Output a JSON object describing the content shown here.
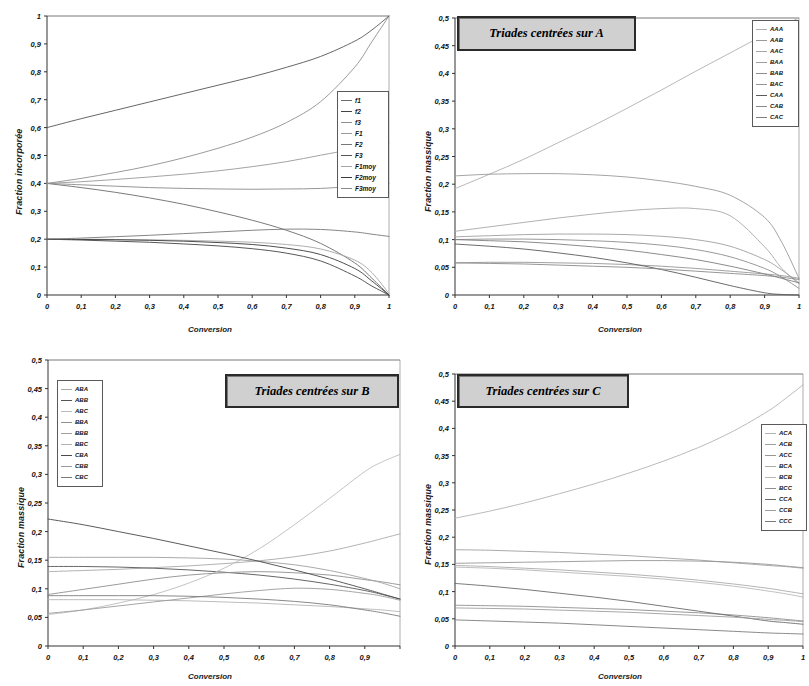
{
  "figure": {
    "panels": [
      {
        "id": "panel-1",
        "title": "",
        "xlabel": "Conversion",
        "ylabel": "Fraction incorporée",
        "xticks": [
          "0",
          "0,1",
          "0,2",
          "0,3",
          "0,4",
          "0,5",
          "0,6",
          "0,7",
          "0,8",
          "0,9",
          "1"
        ],
        "yticks": [
          "0",
          "0,1",
          "0,2",
          "0,3",
          "0,4",
          "0,5",
          "0,6",
          "0,7",
          "0,8",
          "0,9",
          "1"
        ],
        "legend": [
          "f1",
          "f2",
          "f3",
          "F1",
          "F2",
          "F3",
          "F1moy",
          "F2moy",
          "F3moy"
        ]
      },
      {
        "id": "panel-2",
        "title": "Triades centrées sur A",
        "xlabel": "Conversion",
        "ylabel": "Fraction massique",
        "xticks": [
          "0",
          "0,1",
          "0,2",
          "0,3",
          "0,4",
          "0,5",
          "0,6",
          "0,7",
          "0,8",
          "0,9",
          "1"
        ],
        "yticks": [
          "0",
          "0,05",
          "0,1",
          "0,15",
          "0,2",
          "0,25",
          "0,3",
          "0,35",
          "0,4",
          "0,45",
          "0,5"
        ],
        "legend": [
          "AAA",
          "AAB",
          "AAC",
          "BAA",
          "BAB",
          "BAC",
          "CAA",
          "CAB",
          "CAC"
        ]
      },
      {
        "id": "panel-3",
        "title": "Triades centrées sur B",
        "xlabel": "Conversion",
        "ylabel": "Fraction massique",
        "xticks": [
          "0",
          "0,1",
          "0,2",
          "0,3",
          "0,4",
          "0,5",
          "0,6",
          "0,7",
          "0,8",
          "0,9"
        ],
        "yticks": [
          "0",
          "0,05",
          "0,1",
          "0,15",
          "0,2",
          "0,25",
          "0,3",
          "0,35",
          "0,4",
          "0,45",
          "0,5"
        ],
        "legend": [
          "ABA",
          "ABB",
          "ABC",
          "BBA",
          "BBB",
          "BBC",
          "CBA",
          "CBB",
          "CBC"
        ]
      },
      {
        "id": "panel-4",
        "title": "Triades centrées sur C",
        "xlabel": "Conversion",
        "ylabel": "Fraction massique",
        "xticks": [
          "0",
          "0,1",
          "0,2",
          "0,3",
          "0,4",
          "0,5",
          "0,6",
          "0,7",
          "0,8",
          "0,9",
          "1"
        ],
        "yticks": [
          "0",
          "0,05",
          "0,1",
          "0,15",
          "0,2",
          "0,25",
          "0,3",
          "0,35",
          "0,4",
          "0,45",
          "0,5"
        ],
        "legend": [
          "ACA",
          "ACB",
          "ACC",
          "BCA",
          "BCB",
          "BCC",
          "CCA",
          "CCB",
          "CCC"
        ]
      }
    ]
  },
  "chart_data": [
    {
      "type": "line",
      "panel": "panel-1",
      "title": "",
      "xlabel": "Conversion",
      "ylabel": "Fraction incorporée",
      "xlim": [
        0,
        1
      ],
      "ylim": [
        0,
        1
      ],
      "grid": false,
      "legend_position": "right-middle",
      "x": [
        0,
        0.1,
        0.2,
        0.3,
        0.4,
        0.5,
        0.6,
        0.7,
        0.8,
        0.9,
        0.95,
        1
      ],
      "series": [
        {
          "name": "f1",
          "color": "#6b6b6b",
          "values": [
            0.4,
            0.385,
            0.368,
            0.348,
            0.325,
            0.298,
            0.268,
            0.232,
            0.185,
            0.115,
            0.06,
            0.0
          ]
        },
        {
          "name": "f2",
          "color": "#444444",
          "values": [
            0.2,
            0.197,
            0.193,
            0.189,
            0.183,
            0.176,
            0.166,
            0.15,
            0.122,
            0.068,
            0.032,
            0.0
          ]
        },
        {
          "name": "f3",
          "color": "#8f8f8f",
          "values": [
            0.4,
            0.418,
            0.439,
            0.463,
            0.492,
            0.526,
            0.566,
            0.618,
            0.693,
            0.817,
            0.908,
            1.0
          ]
        },
        {
          "name": "F1",
          "color": "#999999",
          "values": [
            0.4,
            0.406,
            0.414,
            0.423,
            0.433,
            0.445,
            0.46,
            0.478,
            0.501,
            0.524,
            0.536,
            0.545
          ]
        },
        {
          "name": "F2",
          "color": "#777777",
          "values": [
            0.2,
            0.204,
            0.209,
            0.214,
            0.22,
            0.226,
            0.232,
            0.236,
            0.235,
            0.226,
            0.218,
            0.21
          ]
        },
        {
          "name": "F3",
          "color": "#555555",
          "values": [
            0.6,
            0.632,
            0.662,
            0.692,
            0.722,
            0.752,
            0.782,
            0.816,
            0.855,
            0.91,
            0.95,
            1.0
          ]
        },
        {
          "name": "F1moy",
          "color": "#a5a5a5",
          "values": [
            0.2,
            0.2,
            0.199,
            0.198,
            0.196,
            0.193,
            0.189,
            0.181,
            0.165,
            0.125,
            0.08,
            0.005
          ]
        },
        {
          "name": "F2moy",
          "color": "#3a3a3a",
          "values": [
            0.2,
            0.199,
            0.198,
            0.196,
            0.193,
            0.188,
            0.181,
            0.168,
            0.145,
            0.095,
            0.05,
            0.0
          ]
        },
        {
          "name": "F3moy",
          "color": "#8a8a8a",
          "values": [
            0.4,
            0.395,
            0.39,
            0.385,
            0.382,
            0.38,
            0.379,
            0.38,
            0.382,
            0.39,
            0.395,
            0.4
          ]
        }
      ]
    },
    {
      "type": "line",
      "panel": "panel-2",
      "title": "Triades centrées sur A",
      "xlabel": "Conversion",
      "ylabel": "Fraction massique",
      "xlim": [
        0,
        1
      ],
      "ylim": [
        0,
        0.5
      ],
      "grid": false,
      "legend_position": "top-right",
      "x": [
        0,
        0.1,
        0.2,
        0.3,
        0.4,
        0.5,
        0.6,
        0.7,
        0.8,
        0.9,
        0.95,
        1
      ],
      "series": [
        {
          "name": "AAA",
          "color": "#b0b0b0",
          "values": [
            0.192,
            0.218,
            0.245,
            0.275,
            0.305,
            0.337,
            0.37,
            0.404,
            0.437,
            0.47,
            0.486,
            0.5
          ]
        },
        {
          "name": "AAB",
          "color": "#9a9a9a",
          "values": [
            0.215,
            0.218,
            0.219,
            0.219,
            0.217,
            0.213,
            0.206,
            0.196,
            0.18,
            0.14,
            0.095,
            0.03
          ]
        },
        {
          "name": "AAC",
          "color": "#a8a8a8",
          "values": [
            0.115,
            0.123,
            0.131,
            0.139,
            0.146,
            0.152,
            0.156,
            0.156,
            0.143,
            0.087,
            0.048,
            0.02
          ]
        },
        {
          "name": "BAA",
          "color": "#9f9f9f",
          "values": [
            0.105,
            0.107,
            0.109,
            0.11,
            0.11,
            0.109,
            0.106,
            0.1,
            0.088,
            0.064,
            0.045,
            0.022
          ]
        },
        {
          "name": "BAB",
          "color": "#8d8d8d",
          "values": [
            0.1,
            0.101,
            0.101,
            0.1,
            0.098,
            0.095,
            0.09,
            0.082,
            0.069,
            0.048,
            0.032,
            0.012
          ]
        },
        {
          "name": "BAC",
          "color": "#959595",
          "values": [
            0.058,
            0.059,
            0.059,
            0.058,
            0.057,
            0.055,
            0.052,
            0.048,
            0.043,
            0.038,
            0.035,
            0.03
          ]
        },
        {
          "name": "CAA",
          "color": "#5a5a5a",
          "values": [
            0.092,
            0.088,
            0.083,
            0.076,
            0.068,
            0.058,
            0.046,
            0.032,
            0.017,
            0.004,
            0.001,
            0.0
          ]
        },
        {
          "name": "CAB",
          "color": "#8a8a8a",
          "values": [
            0.058,
            0.057,
            0.056,
            0.054,
            0.052,
            0.05,
            0.047,
            0.043,
            0.039,
            0.035,
            0.032,
            0.028
          ]
        },
        {
          "name": "CAC",
          "color": "#7e7e7e",
          "values": [
            0.1,
            0.098,
            0.096,
            0.092,
            0.087,
            0.081,
            0.073,
            0.064,
            0.052,
            0.038,
            0.03,
            0.022
          ]
        }
      ]
    },
    {
      "type": "line",
      "panel": "panel-3",
      "title": "Triades centrées sur B",
      "xlabel": "Conversion",
      "ylabel": "Fraction massique",
      "xlim": [
        0,
        1
      ],
      "ylim": [
        0,
        0.5
      ],
      "grid": false,
      "legend_position": "top-left",
      "x": [
        0,
        0.1,
        0.2,
        0.3,
        0.4,
        0.5,
        0.6,
        0.7,
        0.8,
        0.9,
        0.95,
        1
      ],
      "series": [
        {
          "name": "ABA",
          "color": "#a8a8a8",
          "values": [
            0.13,
            0.132,
            0.134,
            0.137,
            0.14,
            0.144,
            0.149,
            0.156,
            0.166,
            0.18,
            0.188,
            0.196
          ]
        },
        {
          "name": "ABB",
          "color": "#555555",
          "values": [
            0.139,
            0.139,
            0.138,
            0.136,
            0.133,
            0.129,
            0.124,
            0.117,
            0.108,
            0.097,
            0.09,
            0.082
          ]
        },
        {
          "name": "ABC",
          "color": "#bcbcbc",
          "values": [
            0.055,
            0.063,
            0.075,
            0.09,
            0.11,
            0.136,
            0.17,
            0.212,
            0.258,
            0.305,
            0.322,
            0.335
          ]
        },
        {
          "name": "BBA",
          "color": "#8f8f8f",
          "values": [
            0.09,
            0.099,
            0.108,
            0.117,
            0.124,
            0.128,
            0.13,
            0.128,
            0.124,
            0.116,
            0.112,
            0.107
          ]
        },
        {
          "name": "BBB",
          "color": "#a0a0a0",
          "values": [
            0.155,
            0.155,
            0.155,
            0.155,
            0.154,
            0.152,
            0.148,
            0.142,
            0.132,
            0.118,
            0.11,
            0.1
          ]
        },
        {
          "name": "BBC",
          "color": "#b4b4b4",
          "values": [
            0.081,
            0.081,
            0.081,
            0.08,
            0.079,
            0.077,
            0.075,
            0.072,
            0.069,
            0.065,
            0.063,
            0.06
          ]
        },
        {
          "name": "CBA",
          "color": "#4a4a4a",
          "values": [
            0.222,
            0.212,
            0.2,
            0.188,
            0.175,
            0.162,
            0.148,
            0.133,
            0.117,
            0.1,
            0.091,
            0.082
          ]
        },
        {
          "name": "CBB",
          "color": "#9b9b9b",
          "values": [
            0.057,
            0.063,
            0.07,
            0.077,
            0.084,
            0.091,
            0.097,
            0.101,
            0.099,
            0.092,
            0.087,
            0.08
          ]
        },
        {
          "name": "CBC",
          "color": "#7a7a7a",
          "values": [
            0.088,
            0.088,
            0.088,
            0.088,
            0.087,
            0.085,
            0.082,
            0.078,
            0.072,
            0.063,
            0.058,
            0.052
          ]
        }
      ]
    },
    {
      "type": "line",
      "panel": "panel-4",
      "title": "Triades centrées sur C",
      "xlabel": "Conversion",
      "ylabel": "Fraction massique",
      "xlim": [
        0,
        1
      ],
      "ylim": [
        0,
        0.5
      ],
      "grid": false,
      "legend_position": "right-upper",
      "x": [
        0,
        0.1,
        0.2,
        0.3,
        0.4,
        0.5,
        0.6,
        0.7,
        0.8,
        0.9,
        0.95,
        1
      ],
      "series": [
        {
          "name": "ACA",
          "color": "#b2b2b2",
          "values": [
            0.235,
            0.248,
            0.263,
            0.28,
            0.298,
            0.318,
            0.34,
            0.365,
            0.395,
            0.432,
            0.455,
            0.48
          ]
        },
        {
          "name": "ACB",
          "color": "#a0a0a0",
          "values": [
            0.177,
            0.176,
            0.174,
            0.172,
            0.169,
            0.166,
            0.162,
            0.158,
            0.153,
            0.148,
            0.146,
            0.143
          ]
        },
        {
          "name": "ACC",
          "color": "#969696",
          "values": [
            0.152,
            0.153,
            0.154,
            0.155,
            0.156,
            0.157,
            0.157,
            0.156,
            0.154,
            0.15,
            0.147,
            0.144
          ]
        },
        {
          "name": "BCA",
          "color": "#aaaaaa",
          "values": [
            0.148,
            0.146,
            0.143,
            0.14,
            0.136,
            0.132,
            0.127,
            0.121,
            0.114,
            0.106,
            0.101,
            0.096
          ]
        },
        {
          "name": "BCB",
          "color": "#b8b8b8",
          "values": [
            0.145,
            0.143,
            0.14,
            0.136,
            0.132,
            0.128,
            0.123,
            0.117,
            0.11,
            0.101,
            0.096,
            0.09
          ]
        },
        {
          "name": "BCC",
          "color": "#8e8e8e",
          "values": [
            0.075,
            0.074,
            0.073,
            0.071,
            0.069,
            0.067,
            0.064,
            0.061,
            0.057,
            0.052,
            0.049,
            0.046
          ]
        },
        {
          "name": "CCA",
          "color": "#6a6a6a",
          "values": [
            0.115,
            0.11,
            0.104,
            0.097,
            0.09,
            0.082,
            0.073,
            0.064,
            0.055,
            0.046,
            0.043,
            0.04
          ]
        },
        {
          "name": "CCB",
          "color": "#9e9e9e",
          "values": [
            0.07,
            0.069,
            0.068,
            0.066,
            0.064,
            0.062,
            0.059,
            0.056,
            0.053,
            0.049,
            0.047,
            0.045
          ]
        },
        {
          "name": "CCC",
          "color": "#7c7c7c",
          "values": [
            0.048,
            0.046,
            0.044,
            0.042,
            0.039,
            0.036,
            0.033,
            0.03,
            0.027,
            0.024,
            0.023,
            0.022
          ]
        }
      ]
    }
  ]
}
